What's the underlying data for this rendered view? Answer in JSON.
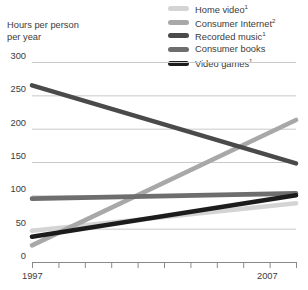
{
  "axis_title": "Hours per person\nper year",
  "legend": [
    {
      "label": "Home video",
      "sup": "1",
      "color": "#d4d4d4"
    },
    {
      "label": "Consumer Internet",
      "sup": "2",
      "color": "#a8a8a8"
    },
    {
      "label": "Recorded music",
      "sup": "1",
      "color": "#4a4a4a"
    },
    {
      "label": "Consumer books",
      "sup": "",
      "color": "#6e6e6e"
    },
    {
      "label": "Video games",
      "sup": "1",
      "color": "#1c1c1c"
    }
  ],
  "chart_data": {
    "type": "line",
    "title": "",
    "xlabel": "",
    "ylabel": "Hours per person per year",
    "x": [
      1997,
      2007
    ],
    "xlim": [
      1997,
      2007
    ],
    "ylim": [
      0,
      300
    ],
    "yticks": [
      0,
      50,
      100,
      150,
      200,
      250,
      300
    ],
    "ytick_labels": [
      "0",
      "50",
      "100",
      "150",
      "200",
      "250",
      "300"
    ],
    "xtick_labels": [
      "1997",
      "2007"
    ],
    "xtick_count": 11,
    "grid": true,
    "legend_position": "top-right",
    "series": [
      {
        "name": "Home video",
        "footnote": "1",
        "color": "#d4d4d4",
        "values": [
          47,
          88
        ]
      },
      {
        "name": "Consumer Internet",
        "footnote": "2",
        "color": "#a8a8a8",
        "values": [
          25,
          213
        ]
      },
      {
        "name": "Recorded music",
        "footnote": "1",
        "color": "#4a4a4a",
        "values": [
          265,
          148
        ]
      },
      {
        "name": "Consumer books",
        "footnote": "",
        "color": "#6e6e6e",
        "values": [
          95,
          103
        ]
      },
      {
        "name": "Video games",
        "footnote": "1",
        "color": "#1c1c1c",
        "values": [
          38,
          100
        ]
      }
    ]
  }
}
